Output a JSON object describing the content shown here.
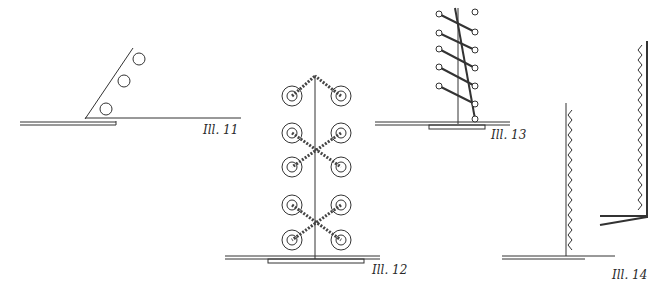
{
  "illustrations": [
    {
      "id": 11,
      "label": "Ill. 11",
      "description": "Angled board with three holes meeting a base line"
    },
    {
      "id": 12,
      "label": "Ill. 12",
      "description": "Vertical post with paired ring holes, cross-laced twisted cord"
    },
    {
      "id": 13,
      "label": "Ill. 13",
      "description": "Vertical post with diagonal parallel lacing between holes"
    },
    {
      "id": 14,
      "label": "Ill. 14",
      "description": "Two vertical panels with zigzag stitching on base lines"
    }
  ],
  "colors": {
    "ink": "#333333",
    "paper": "#ffffff"
  }
}
